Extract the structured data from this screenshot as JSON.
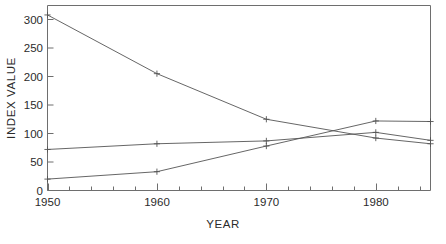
{
  "chart_data": {
    "type": "line",
    "title": "",
    "xlabel": "YEAR",
    "ylabel": "INDEX VALUE",
    "xlim": [
      1950,
      1985
    ],
    "ylim": [
      0,
      320
    ],
    "grid": false,
    "legend": "none",
    "x_ticks_major": [
      1950,
      1960,
      1970,
      1980
    ],
    "x_tick_labels": [
      "1950",
      "1960",
      "1970",
      "1980"
    ],
    "x_tick_minor_step": 2,
    "y_ticks": [
      0,
      50,
      100,
      150,
      200,
      250,
      300
    ],
    "y_tick_labels": [
      "0",
      "50",
      "100",
      "150",
      "200",
      "250",
      "300"
    ],
    "x": [
      1950,
      1960,
      1970,
      1980,
      1985
    ],
    "series": [
      {
        "name": "declining-series",
        "marker": "plus",
        "color": "#555555",
        "values": [
          308,
          205,
          125,
          92,
          82
        ]
      },
      {
        "name": "flat-series",
        "marker": "plus",
        "color": "#555555",
        "values": [
          72,
          82,
          87,
          102,
          88
        ]
      },
      {
        "name": "rising-series",
        "marker": "plus",
        "color": "#555555",
        "values": [
          20,
          33,
          78,
          122,
          121
        ]
      }
    ]
  },
  "axes": {
    "x_title": "YEAR",
    "y_title": "INDEX VALUE"
  },
  "ticks": {
    "y": [
      "300",
      "250",
      "200",
      "150",
      "100",
      "50",
      "0"
    ],
    "x": [
      "1950",
      "1960",
      "1970",
      "1980"
    ]
  },
  "colors": {
    "line": "#666666",
    "axis": "#555555",
    "text": "#2b2b2b",
    "background": "#ffffff"
  }
}
